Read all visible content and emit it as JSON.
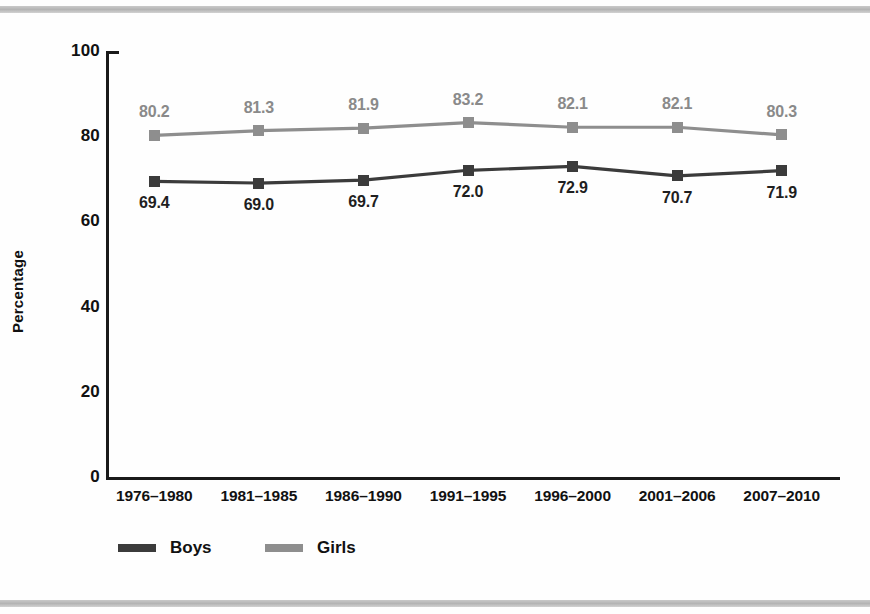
{
  "figure": {
    "background_color": "#fefefe",
    "rule_color": "#c4c4c4"
  },
  "chart_data": {
    "type": "line",
    "title": "",
    "xlabel": "",
    "ylabel": "Percentage",
    "ylim": [
      0,
      100
    ],
    "yticks": [
      0,
      20,
      40,
      60,
      80,
      100
    ],
    "grid": false,
    "legend_position": "bottom-left",
    "categories": [
      "1976–1980",
      "1981–1985",
      "1986–1990",
      "1991–1995",
      "1996–2000",
      "2001–2006",
      "2007–2010"
    ],
    "series": [
      {
        "name": "Boys",
        "color": "#3b3b3b",
        "label_position": "below",
        "values": [
          69.4,
          69.0,
          69.7,
          72.0,
          72.9,
          70.7,
          71.9
        ],
        "value_labels": [
          "69.4",
          "69.0",
          "69.7",
          "72.0",
          "72.9",
          "70.7",
          "71.9"
        ]
      },
      {
        "name": "Girls",
        "color": "#8e8e8e",
        "label_position": "above",
        "values": [
          80.2,
          81.3,
          81.9,
          83.2,
          82.1,
          82.1,
          80.3
        ],
        "value_labels": [
          "80.2",
          "81.3",
          "81.9",
          "83.2",
          "82.1",
          "82.1",
          "80.3"
        ]
      }
    ]
  },
  "legend": {
    "items": [
      {
        "label": "Boys",
        "color": "#3b3b3b"
      },
      {
        "label": "Girls",
        "color": "#8e8e8e"
      }
    ]
  }
}
